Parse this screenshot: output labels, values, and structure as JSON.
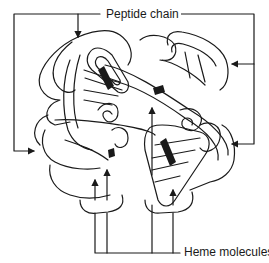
{
  "diagram": {
    "labels": {
      "peptide_chain": "Peptide chain",
      "heme_molecules": "Heme molecules"
    },
    "colors": {
      "line": "#1a1a1a",
      "heme_fill": "#1a1a1a",
      "background": "#ffffff"
    },
    "arrows": {
      "peptide_chain_count": 4,
      "heme_molecules_count": 4
    }
  }
}
